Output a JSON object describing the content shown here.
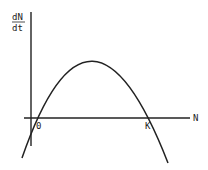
{
  "diagram": {
    "type": "logistic growth rate curve",
    "y_axis_label_numerator": "dN",
    "y_axis_label_denominator": "dt",
    "x_axis_label": "N",
    "origin_label": "0",
    "carrying_capacity_label": "K",
    "line_color": "#222222",
    "background": "#ffffff"
  }
}
